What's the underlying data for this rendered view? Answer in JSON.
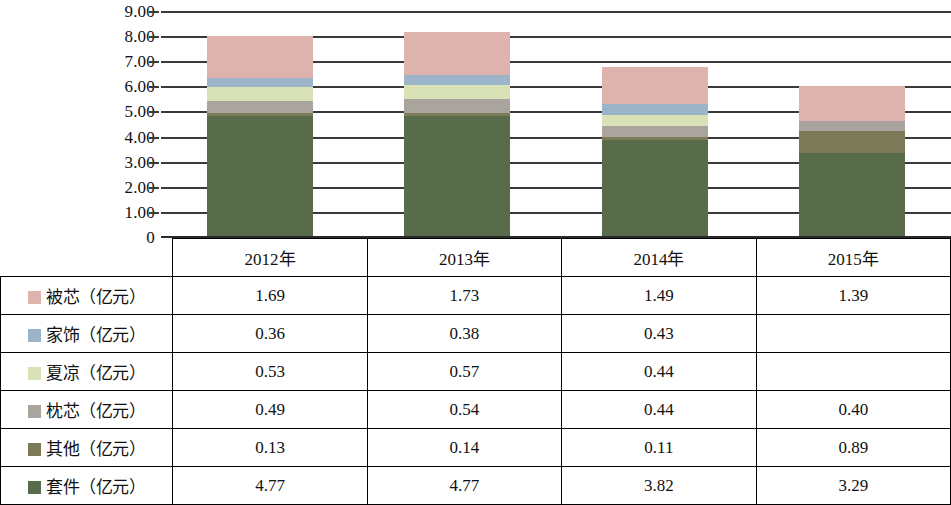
{
  "chart_data": {
    "type": "bar",
    "stacked": true,
    "title": "",
    "xlabel": "",
    "ylabel": "",
    "categories": [
      "2012年",
      "2013年",
      "2014年",
      "2015年"
    ],
    "ylim": [
      0,
      9
    ],
    "yticks": [
      "0",
      "1.00",
      "2.00",
      "3.00",
      "4.00",
      "5.00",
      "6.00",
      "7.00",
      "8.00",
      "9.00"
    ],
    "ytick_values": [
      0,
      1,
      2,
      3,
      4,
      5,
      6,
      7,
      8,
      9
    ],
    "grid": true,
    "legend_position": "table-row-labels",
    "series": [
      {
        "name": "套件（亿元）",
        "color": "#586b4b",
        "values": [
          4.77,
          4.77,
          3.82,
          3.29
        ]
      },
      {
        "name": "其他（亿元）",
        "color": "#7d7a5a",
        "values": [
          0.13,
          0.14,
          0.11,
          0.89
        ]
      },
      {
        "name": "枕芯（亿元）",
        "color": "#a9a49d",
        "values": [
          0.49,
          0.54,
          0.44,
          0.4
        ]
      },
      {
        "name": "夏凉（亿元）",
        "color": "#d8e2b6",
        "values": [
          0.53,
          0.57,
          0.44,
          null
        ]
      },
      {
        "name": "家饰（亿元）",
        "color": "#9cb4c8",
        "values": [
          0.36,
          0.38,
          0.43,
          null
        ]
      },
      {
        "name": "被芯（亿元）",
        "color": "#dfb3ad",
        "values": [
          1.69,
          1.73,
          1.49,
          1.39
        ]
      }
    ],
    "totals": [
      7.97,
      8.13,
      6.73,
      5.97
    ]
  },
  "table": {
    "corner_label": "",
    "columns": [
      "2012年",
      "2013年",
      "2014年",
      "2015年"
    ],
    "rows": [
      {
        "label": "被芯（亿元）",
        "color": "#dfb3ad",
        "values": [
          "1.69",
          "1.73",
          "1.49",
          "1.39"
        ]
      },
      {
        "label": "家饰（亿元）",
        "color": "#9cb4c8",
        "values": [
          "0.36",
          "0.38",
          "0.43",
          ""
        ]
      },
      {
        "label": "夏凉（亿元）",
        "color": "#d8e2b6",
        "values": [
          "0.53",
          "0.57",
          "0.44",
          ""
        ]
      },
      {
        "label": "枕芯（亿元）",
        "color": "#a9a49d",
        "values": [
          "0.49",
          "0.54",
          "0.44",
          "0.40"
        ]
      },
      {
        "label": "其他（亿元）",
        "color": "#7d7a5a",
        "values": [
          "0.13",
          "0.14",
          "0.11",
          "0.89"
        ]
      },
      {
        "label": "套件（亿元）",
        "color": "#586b4b",
        "values": [
          "4.77",
          "4.77",
          "3.82",
          "3.29"
        ]
      }
    ]
  }
}
